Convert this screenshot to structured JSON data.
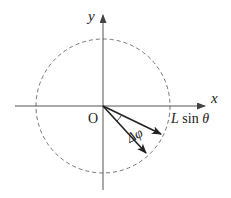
{
  "diagram": {
    "axes": {
      "x_label": "x",
      "y_label": "y",
      "origin_label": "O"
    },
    "circle": {
      "style": "dashed",
      "radius_label": "L sin θ",
      "radius_label_parts": {
        "L": "L",
        "sin": " sin ",
        "theta": "θ"
      }
    },
    "vectors": [
      {
        "name": "vector-1"
      },
      {
        "name": "vector-2"
      }
    ],
    "angle_label": "Δφ",
    "colors": {
      "line": "#333333",
      "axis": "#555555",
      "dashed": "#777777",
      "text": "#222222"
    }
  }
}
